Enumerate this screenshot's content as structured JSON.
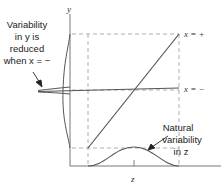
{
  "diagram": {
    "axes": {
      "y_label": "y",
      "x_label": "z"
    },
    "lines": [
      {
        "name": "x-plus-line",
        "label": "x = +"
      },
      {
        "name": "x-minus-line",
        "label": "x = −"
      }
    ],
    "annotations": {
      "left": [
        "Variability",
        "in y is",
        "reduced",
        "when x = −"
      ],
      "bottom": [
        "Natural",
        "variability",
        "in z"
      ]
    },
    "colors": {
      "line": "#555555",
      "dashed": "#999999",
      "axis": "#666666"
    }
  }
}
